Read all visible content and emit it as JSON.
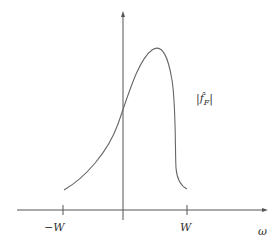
{
  "diagram": {
    "type": "function-plot",
    "colors": {
      "axis": "#555555",
      "curve": "#666666",
      "text": "#333333",
      "background": "#ffffff"
    },
    "axes": {
      "x": {
        "label": "ω",
        "ticks": [
          {
            "label": "−W",
            "x": 63
          },
          {
            "label": "W",
            "x": 187
          }
        ]
      },
      "y": {
        "label": ""
      }
    },
    "curve": {
      "label": "|f̂_F|",
      "label_text": "|f̂",
      "label_sub": "F",
      "label_close": "|",
      "points_px": [
        [
          64,
          190
        ],
        [
          123,
          110
        ],
        [
          157,
          49
        ],
        [
          176,
          175
        ],
        [
          187,
          189
        ]
      ]
    }
  }
}
